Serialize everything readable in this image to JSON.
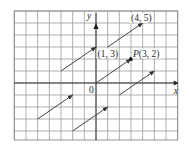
{
  "colors": {
    "background": "#ffffff",
    "grid": "#9a9a9a",
    "border": "#8a8a8a",
    "axis": "#333333",
    "arrow": "#444444",
    "text": "#2a2a2a"
  },
  "axes": {
    "x_label": "x",
    "y_label": "y",
    "origin_label": "0"
  },
  "grid": {
    "x_min": -7,
    "x_max": 7,
    "y_min": -4.75,
    "y_max": 6,
    "step": 1
  },
  "labels": [
    {
      "id": "label-4-5",
      "text": "(4, 5)",
      "x": 4,
      "y": 5
    },
    {
      "id": "label-1-3",
      "text": "(1, 3)",
      "x": 1,
      "y": 3
    },
    {
      "id": "label-P",
      "prefix": "P",
      "text": "(3, 2)",
      "x": 3,
      "y": 2
    }
  ],
  "chart_data": {
    "type": "vector-diagram",
    "title": "",
    "xlabel": "x",
    "ylabel": "y",
    "xlim": [
      -7,
      7
    ],
    "ylim": [
      -4.75,
      6
    ],
    "grid": true,
    "vector": [
      3,
      2
    ],
    "point": {
      "name": "P",
      "x": 3,
      "y": 2
    },
    "arrows": [
      {
        "from": [
          -3,
          1
        ],
        "to": [
          0,
          3
        ]
      },
      {
        "from": [
          1,
          3
        ],
        "to": [
          4,
          5
        ]
      },
      {
        "from": [
          0,
          0
        ],
        "to": [
          3,
          2
        ]
      },
      {
        "from": [
          2,
          -1
        ],
        "to": [
          5,
          1
        ]
      },
      {
        "from": [
          -5,
          -3
        ],
        "to": [
          -2,
          -1
        ]
      },
      {
        "from": [
          -2,
          -4
        ],
        "to": [
          1,
          -2
        ]
      }
    ],
    "annotations": [
      "(4, 5)",
      "(1, 3)",
      "P(3, 2)",
      "0"
    ]
  }
}
